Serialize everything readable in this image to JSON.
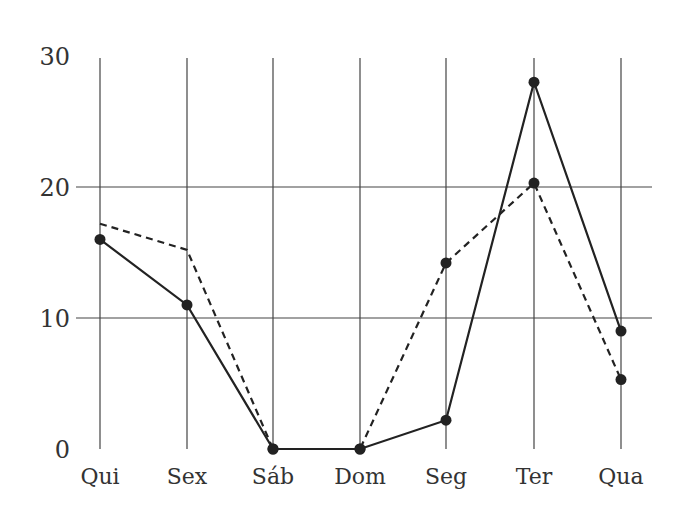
{
  "chart_data": {
    "type": "line",
    "title": "",
    "xlabel": "",
    "ylabel": "",
    "categories": [
      "Qui",
      "Sex",
      "Sáb",
      "Dom",
      "Seg",
      "Ter",
      "Qua"
    ],
    "yticks": [
      0,
      10,
      20,
      30
    ],
    "ylim": [
      0,
      30
    ],
    "grid": true,
    "legend": null,
    "series": [
      {
        "name": "solid",
        "style": "solid",
        "markers": [
          0,
          1,
          2,
          3,
          4,
          5,
          6
        ],
        "values": [
          16,
          11,
          0,
          0,
          2.2,
          28,
          9
        ]
      },
      {
        "name": "dashed",
        "style": "dashed",
        "markers": [
          2,
          3,
          4,
          5,
          6
        ],
        "values": [
          17.2,
          15.2,
          0,
          0,
          14.2,
          20.3,
          5.3
        ]
      }
    ]
  }
}
